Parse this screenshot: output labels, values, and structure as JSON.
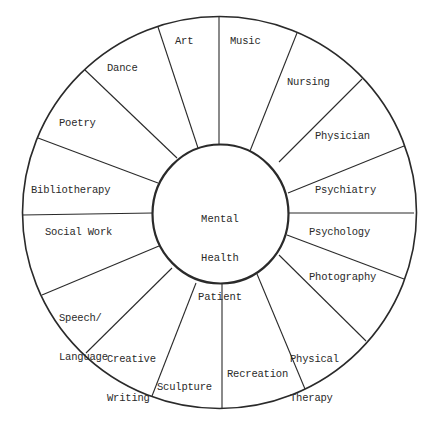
{
  "diagram": {
    "type": "wheel",
    "center": {
      "label_lines": [
        "Mental",
        "Health",
        "Patient"
      ]
    },
    "segments": [
      {
        "id": "art",
        "label": "Art"
      },
      {
        "id": "music",
        "label": "Music"
      },
      {
        "id": "nursing",
        "label": "Nursing"
      },
      {
        "id": "physician",
        "label": "Physician"
      },
      {
        "id": "psychiatry",
        "label": "Psychiatry"
      },
      {
        "id": "psychology",
        "label": "Psychology"
      },
      {
        "id": "photography",
        "label": "Photography"
      },
      {
        "id": "physical-therapy",
        "label_lines": [
          "Physical",
          "Therapy"
        ]
      },
      {
        "id": "recreation",
        "label": "Recreation"
      },
      {
        "id": "sculpture",
        "label": "Sculpture"
      },
      {
        "id": "creative-writing",
        "label_lines": [
          "Creative",
          "Writing"
        ]
      },
      {
        "id": "speech-language",
        "label_lines": [
          "Speech/",
          "Language"
        ]
      },
      {
        "id": "social-work",
        "label": "Social Work"
      },
      {
        "id": "bibliotherapy",
        "label": "Bibliotherapy"
      },
      {
        "id": "poetry",
        "label": "Poetry"
      },
      {
        "id": "dance",
        "label": "Dance"
      }
    ],
    "colors": {
      "line": "#2a2a2a",
      "background": "#ffffff"
    }
  }
}
